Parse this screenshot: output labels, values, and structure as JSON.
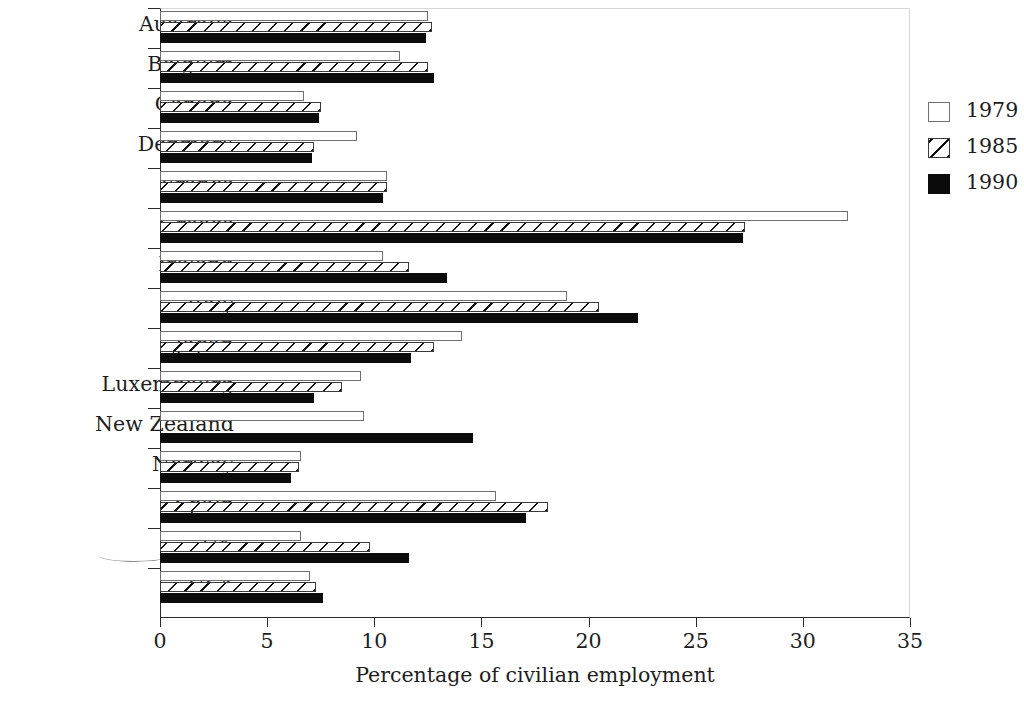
{
  "chart_data": {
    "type": "bar",
    "orientation": "horizontal",
    "title": "",
    "xlabel": "Percentage of  civilian employment",
    "ylabel": "",
    "xlim": [
      0,
      35
    ],
    "xticks": [
      0,
      5,
      10,
      15,
      20,
      25,
      30,
      35
    ],
    "xtick_labels": [
      "0",
      "5",
      "10",
      "15",
      "20",
      "25",
      "30",
      "35"
    ],
    "grid": false,
    "legend_position": "right",
    "categories": [
      "Australia",
      "Belgium",
      "Canada",
      "Denmark",
      "France",
      "Greece",
      "Ireland",
      "Italy",
      "Japan",
      "Luxembourg",
      "New Zealand",
      "Norway",
      "Spain",
      "UK",
      "USA"
    ],
    "series": [
      {
        "name": "1979",
        "fill": "white",
        "values": [
          12.5,
          11.2,
          6.7,
          9.2,
          10.6,
          32.1,
          10.4,
          19.0,
          14.1,
          9.4,
          9.5,
          6.6,
          15.7,
          6.6,
          7.0
        ]
      },
      {
        "name": "1985",
        "fill": "hatched",
        "values": [
          12.7,
          12.5,
          7.5,
          7.2,
          10.6,
          27.3,
          11.6,
          20.5,
          12.8,
          8.5,
          null,
          6.5,
          18.1,
          9.8,
          7.3
        ]
      },
      {
        "name": "1990",
        "fill": "black",
        "values": [
          12.4,
          12.8,
          7.4,
          7.1,
          10.4,
          27.2,
          13.4,
          22.3,
          11.7,
          7.2,
          14.6,
          6.1,
          17.1,
          11.6,
          7.6
        ]
      }
    ]
  },
  "legend": {
    "items": [
      {
        "label": "1979",
        "swatch": "white-square"
      },
      {
        "label": "1985",
        "swatch": "hatched-square"
      },
      {
        "label": "1990",
        "swatch": "black-square"
      }
    ]
  },
  "colors": {
    "bar_1990": "#0b0b0b",
    "bar_outline": "#6f6f6f",
    "hatch": "#111111",
    "axis": "#2b2b2b",
    "text": "#1d1d1d",
    "background": "#ffffff"
  },
  "annotations": {
    "uk_underline": true
  }
}
